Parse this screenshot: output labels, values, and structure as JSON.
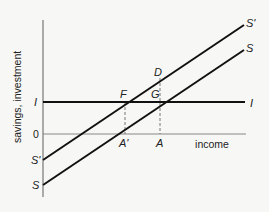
{
  "diagram": {
    "axes": {
      "y_label": "savings, investment",
      "x_label": "income",
      "origin_label": "0"
    },
    "lines": [
      {
        "id": "investment",
        "left_label": "I",
        "right_label": "I"
      },
      {
        "id": "savings-new",
        "left_label": "S'",
        "right_label": "S'"
      },
      {
        "id": "savings",
        "left_label": "S",
        "right_label": "S"
      }
    ],
    "points": {
      "F": "F",
      "G": "G",
      "D": "D"
    },
    "x_markers": {
      "A_prime": "A'",
      "A": "A"
    }
  }
}
